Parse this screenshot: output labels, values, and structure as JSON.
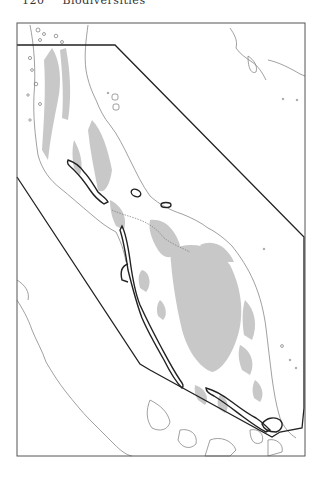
{
  "page": {
    "running_head": {
      "page_number": "120",
      "title": "Biodiversities"
    }
  },
  "map": {
    "frame": {
      "x": 17,
      "y": 23,
      "width": 288,
      "height": 433
    },
    "colors": {
      "frame": "#555555",
      "coastline": "#777777",
      "highland": "#c8c8c8",
      "boundary_polygon": "#222222",
      "bold_outline": "#222222",
      "background": "#ffffff"
    },
    "features": {
      "study_area_polygon": "outlined study area boundary",
      "bold_outlined_zones": 3,
      "small_ovals": 2
    }
  }
}
